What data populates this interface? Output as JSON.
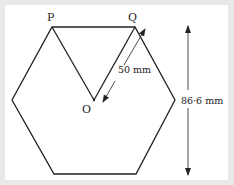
{
  "diagram": {
    "type": "regular-hexagon-dimension-figure",
    "labels": {
      "vertex_p": "P",
      "vertex_q": "Q",
      "center_o": "O",
      "radius_dimension": "50 mm",
      "height_dimension": "86·6 mm"
    },
    "colors": {
      "background": "#e9e9e9",
      "card": "#ffffff",
      "stroke": "#222222"
    }
  }
}
